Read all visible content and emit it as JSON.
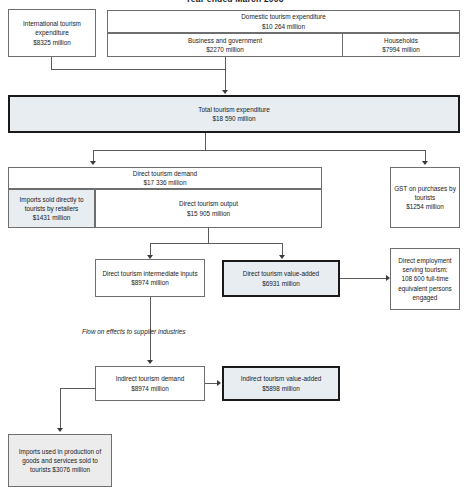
{
  "title": "Year ended March 2003",
  "diagram": {
    "type": "flowchart",
    "currency_note": "million",
    "nodes": {
      "international": {
        "label": "International tourism expenditure",
        "value": "$8325 million"
      },
      "domestic": {
        "label": "Domestic tourism expenditure",
        "value": "$10 264 million"
      },
      "business_government": {
        "label": "Business and government",
        "value": "$2270 million"
      },
      "households": {
        "label": "Households",
        "value": "$7994 million"
      },
      "total_expenditure": {
        "label": "Total tourism expenditure",
        "value": "$18 590 million"
      },
      "direct_demand": {
        "label": "Direct tourism demand",
        "value": "$17 336 million"
      },
      "imports_retailers": {
        "label": "Imports sold directly to tourists by retailers",
        "value": "$1431 million"
      },
      "direct_output": {
        "label": "Direct tourism output",
        "value": "$15 905 million"
      },
      "gst": {
        "label": "GST on purchases by tourists",
        "value": "$1254 million"
      },
      "intermediate_inputs": {
        "label": "Direct tourism intermediate inputs",
        "value": "$8974 million"
      },
      "direct_value_added": {
        "label": "Direct tourism value-added",
        "value": "$6931 million"
      },
      "direct_employment": {
        "label": "Direct employment serving tourism:",
        "value": "108 600 full-time equivalent persons engaged"
      },
      "flow_on_note": {
        "label": "Flow on effects to supplier industries"
      },
      "indirect_demand": {
        "label": "Indirect tourism demand",
        "value": "$8974 million"
      },
      "indirect_value_added": {
        "label": "Indirect tourism value-added",
        "value": "$5898 million"
      },
      "imports_production": {
        "label": "Imports used in production of goods and services sold to tourists $3076 million"
      }
    }
  }
}
